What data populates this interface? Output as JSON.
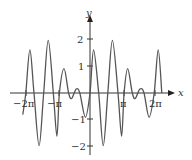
{
  "chart_data": {
    "type": "line",
    "title": "",
    "xlabel": "x",
    "ylabel": "y",
    "x_ticks": [
      "-2π",
      "-π",
      "π",
      "2π"
    ],
    "y_ticks": [
      "2",
      "1",
      "-1",
      "-2"
    ],
    "xlim": [
      -6.9,
      7.1
    ],
    "ylim": [
      -2.3,
      2.4
    ],
    "grid": false,
    "series": [
      {
        "name": "f(x)",
        "points": [
          [
            -6.6,
            -0.8
          ],
          [
            -6.3,
            0.0
          ],
          [
            -5.9,
            1.6
          ],
          [
            -5.5,
            0.0
          ],
          [
            -5.0,
            -1.95
          ],
          [
            -4.55,
            0.0
          ],
          [
            -4.1,
            1.95
          ],
          [
            -3.6,
            0.0
          ],
          [
            -3.25,
            -1.6
          ],
          [
            -3.0,
            0.0
          ],
          [
            -2.55,
            0.9
          ],
          [
            -2.1,
            0.0
          ],
          [
            -1.8,
            -0.2
          ],
          [
            -1.35,
            0.15
          ],
          [
            -1.0,
            0.0
          ],
          [
            -0.45,
            -0.9
          ],
          [
            0.0,
            0.0
          ],
          [
            0.35,
            1.6
          ],
          [
            0.85,
            0.0
          ],
          [
            1.3,
            -1.95
          ],
          [
            1.75,
            0.0
          ],
          [
            2.2,
            1.95
          ],
          [
            2.75,
            0.0
          ],
          [
            3.1,
            -1.6
          ],
          [
            3.35,
            0.0
          ],
          [
            3.7,
            0.9
          ],
          [
            4.15,
            0.0
          ],
          [
            4.45,
            -0.2
          ],
          [
            4.9,
            0.15
          ],
          [
            5.3,
            0.0
          ],
          [
            5.8,
            -0.9
          ],
          [
            6.3,
            0.0
          ],
          [
            6.7,
            1.6
          ],
          [
            7.05,
            0.0
          ]
        ]
      }
    ]
  },
  "labels": {
    "x_axis": "x",
    "y_axis": "y",
    "tick_neg2pi": "−2π",
    "tick_negpi": "−π",
    "tick_pi": "π",
    "tick_2pi": "2π",
    "tick_y2": "2",
    "tick_y1": "1",
    "tick_yn1": "−1",
    "tick_yn2": "−2"
  }
}
